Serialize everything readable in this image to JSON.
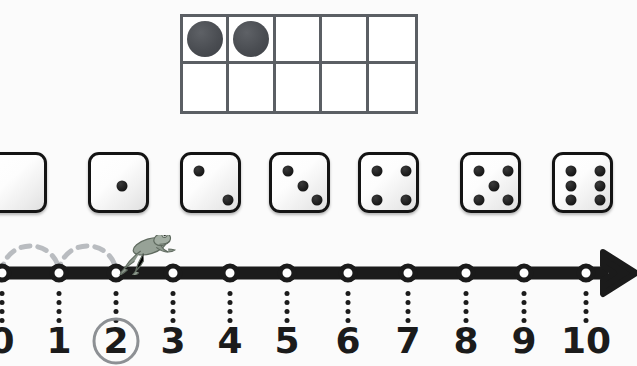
{
  "worksheet": {
    "title": "Counting to 10 — ten frame, dice and number line",
    "background_color": "#fbfbfb"
  },
  "ten_frame": {
    "name": "ten-frame",
    "columns": 5,
    "rows": 2,
    "total_cells": 10,
    "filled_count": 2,
    "counter_color": "#4a4d52",
    "grid_line_color": "#5b5f64",
    "cells_filled": [
      true,
      true,
      false,
      false,
      false,
      false,
      false,
      false,
      false,
      false
    ]
  },
  "dice_row": {
    "name": "dice-row",
    "face_color": "#ffffff",
    "pip_color": "#1c1c1c",
    "border_color": "#141414",
    "dice": [
      {
        "value": 0,
        "label": "0",
        "x": -14
      },
      {
        "value": 1,
        "label": "1",
        "x": 88
      },
      {
        "value": 2,
        "label": "2",
        "x": 180
      },
      {
        "value": 3,
        "label": "3",
        "x": 269
      },
      {
        "value": 4,
        "label": "4",
        "x": 358
      },
      {
        "value": 5,
        "label": "5",
        "x": 460
      },
      {
        "value": 6,
        "label": "6",
        "x": 552
      }
    ]
  },
  "number_line": {
    "name": "number-line",
    "min": 0,
    "max": 10,
    "line_color": "#1b1b1b",
    "highlight_color": "#8d9094",
    "jump_arc_color": "#b9bcc0",
    "current_position": 2,
    "highlighted_label": "2",
    "jumps": [
      {
        "from": 0,
        "to": 1
      },
      {
        "from": 1,
        "to": 2
      }
    ],
    "ticks": [
      {
        "value": 0,
        "label": "0",
        "x": 2
      },
      {
        "value": 1,
        "label": "1",
        "x": 59
      },
      {
        "value": 2,
        "label": "2",
        "x": 116
      },
      {
        "value": 3,
        "label": "3",
        "x": 173
      },
      {
        "value": 4,
        "label": "4",
        "x": 230
      },
      {
        "value": 5,
        "label": "5",
        "x": 287
      },
      {
        "value": 6,
        "label": "6",
        "x": 348
      },
      {
        "value": 7,
        "label": "7",
        "x": 408
      },
      {
        "value": 8,
        "label": "8",
        "x": 466
      },
      {
        "value": 9,
        "label": "9",
        "x": 524
      },
      {
        "value": 10,
        "label": "10",
        "x": 586
      }
    ],
    "arrow": {
      "name": "right-arrow",
      "direction": "right"
    },
    "frog": {
      "name": "frog",
      "position_value": 2,
      "x": 145,
      "body_color": "#8e9a8e",
      "state": "leaping"
    }
  }
}
